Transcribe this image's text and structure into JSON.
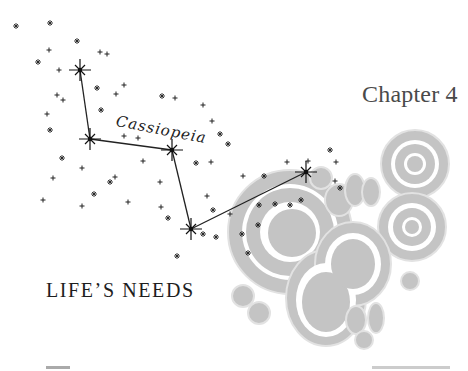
{
  "page": {
    "chapter_label": "Chapter 4",
    "chapter_title": "LIFE’S NEEDS",
    "illustration": {
      "constellation_name": "Cassiopeia",
      "colors": {
        "stars": "#222222",
        "cells_fill": "#bdbdbd",
        "cells_outline": "#d6d6d6"
      }
    }
  }
}
